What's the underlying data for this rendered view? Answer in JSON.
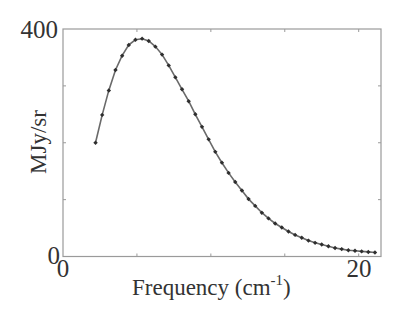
{
  "chart_data": {
    "type": "line",
    "title": "",
    "xlabel": "Frequency (cm",
    "xlabel_sup": "-1",
    "xlabel_close": ")",
    "ylabel": "MJy/sr",
    "xlim": [
      0,
      21.5
    ],
    "ylim": [
      0,
      400
    ],
    "x_tick_labels": [
      {
        "value": 0,
        "label": "0"
      },
      {
        "value": 20,
        "label": "20"
      }
    ],
    "y_tick_labels": [
      {
        "value": 0,
        "label": "0"
      },
      {
        "value": 400,
        "label": "400"
      }
    ],
    "x_minor_ticks": [
      0,
      5,
      10,
      15,
      20
    ],
    "y_minor_ticks": [
      0,
      100,
      200,
      300,
      400
    ],
    "grid": false,
    "legend": null,
    "series": [
      {
        "name": "spectrum",
        "marker": "diamond",
        "color": "#2e2e2e",
        "x": [
          2.2,
          2.65,
          3.1,
          3.55,
          4.0,
          4.45,
          4.9,
          5.35,
          5.8,
          6.25,
          6.7,
          7.15,
          7.6,
          8.05,
          8.5,
          8.95,
          9.4,
          9.85,
          10.3,
          10.75,
          11.2,
          11.65,
          12.1,
          12.55,
          13.0,
          13.45,
          13.9,
          14.35,
          14.8,
          15.25,
          15.7,
          16.15,
          16.6,
          17.05,
          17.5,
          17.95,
          18.4,
          18.85,
          19.3,
          19.75,
          20.2,
          20.65,
          21.1
        ],
        "y": [
          200,
          249,
          292,
          328,
          353,
          372,
          381,
          383,
          379,
          369,
          355,
          336,
          315,
          294,
          273,
          250,
          228,
          206,
          184,
          165,
          147,
          131,
          116,
          101,
          89,
          77,
          67,
          58,
          51,
          44,
          38,
          33,
          28,
          24,
          21,
          18,
          15,
          13,
          11,
          10,
          9,
          8,
          7
        ]
      }
    ]
  }
}
